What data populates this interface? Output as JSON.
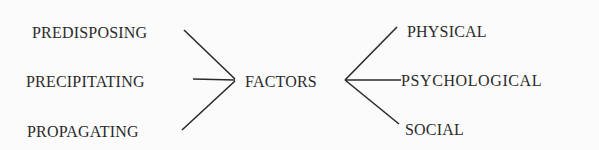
{
  "diagram": {
    "center": {
      "label": "FACTORS"
    },
    "left_nodes": [
      {
        "label": "PREDISPOSING"
      },
      {
        "label": "PRECIPITATING"
      },
      {
        "label": "PROPAGATING"
      }
    ],
    "right_nodes": [
      {
        "label": "PHYSICAL"
      },
      {
        "label": "PSYCHOLOGICAL"
      },
      {
        "label": "SOCIAL"
      }
    ],
    "line_color": "#2a2a2a"
  }
}
